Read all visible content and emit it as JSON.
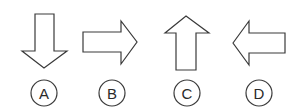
{
  "figure": {
    "options": [
      {
        "label": "A",
        "arrow_direction": "down",
        "icon": "arrow-down-icon"
      },
      {
        "label": "B",
        "arrow_direction": "right",
        "icon": "arrow-right-icon"
      },
      {
        "label": "C",
        "arrow_direction": "up",
        "icon": "arrow-up-icon"
      },
      {
        "label": "D",
        "arrow_direction": "left",
        "icon": "arrow-left-icon"
      }
    ],
    "colors": {
      "stroke": "#3a3a3a",
      "fill": "#ffffff",
      "text": "#2a2a2a"
    }
  }
}
